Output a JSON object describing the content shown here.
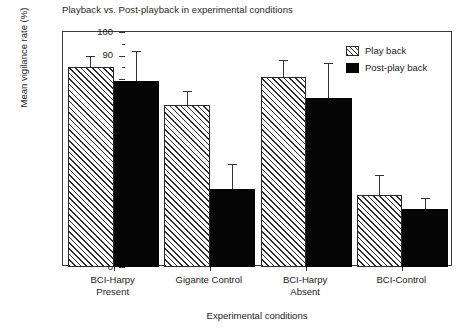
{
  "chart_data": {
    "type": "bar",
    "title": "Playback vs. Post-playback in experimental conditions",
    "xlabel": "Experimental conditions",
    "ylabel": "Mean vigilance rate (%)",
    "ylim": [
      0,
      100
    ],
    "ytick_step": 10,
    "yticks": [
      "0",
      "10",
      "20",
      "30",
      "40",
      "50",
      "60",
      "70",
      "80",
      "90",
      "100"
    ],
    "grid": false,
    "legend_position": "top-right",
    "categories": [
      "BCI-Harpy Present",
      "Gigante Control",
      "BCI-Harpy Absent",
      "BCI-Control"
    ],
    "category_lines": [
      [
        "BCI-Harpy",
        "Present"
      ],
      [
        "Gigante Control",
        ""
      ],
      [
        "BCI-Harpy",
        "Absent"
      ],
      [
        "BCI-Control",
        ""
      ]
    ],
    "series": [
      {
        "name": "Play back",
        "fill": "hatched",
        "color": "#2b2b2b",
        "values": [
          85,
          69,
          81,
          30.5
        ],
        "errors_upper": [
          90,
          75,
          88,
          39
        ]
      },
      {
        "name": "Post-play back",
        "fill": "solid",
        "color": "#050505",
        "values": [
          79,
          33,
          72,
          24.5
        ],
        "errors_upper": [
          92,
          44,
          87,
          29.5
        ]
      }
    ]
  },
  "legend": {
    "items": [
      {
        "label": "Play back",
        "style": "playback"
      },
      {
        "label": "Post-play back",
        "style": "postplayback"
      }
    ]
  }
}
